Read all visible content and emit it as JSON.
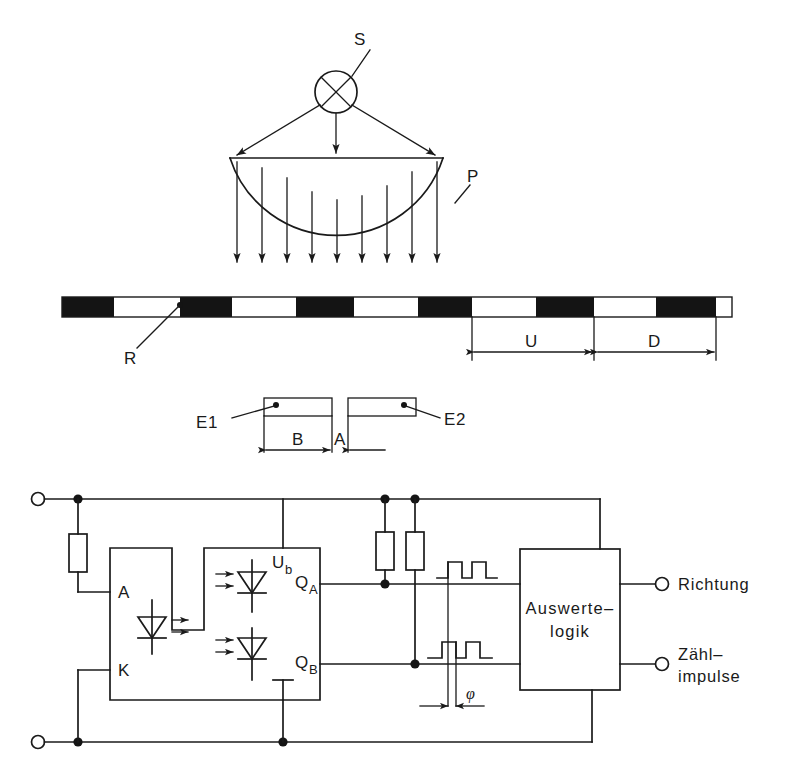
{
  "figure": {
    "kind": "technical-schematic",
    "ink_color": "#1a1a1a",
    "background_color": "#ffffff"
  },
  "optics": {
    "source_label": "S",
    "lens_label": "P",
    "light_ray_count": 3,
    "parallel_beam_arrow_count": 9
  },
  "scale": {
    "grating_label": "R",
    "pitch_label": "U",
    "dark_label": "D",
    "segments": [
      {
        "x": 62,
        "w": 52,
        "fill": "black"
      },
      {
        "x": 114,
        "w": 66,
        "fill": "white"
      },
      {
        "x": 180,
        "w": 52,
        "fill": "black"
      },
      {
        "x": 232,
        "w": 64,
        "fill": "white"
      },
      {
        "x": 296,
        "w": 58,
        "fill": "black"
      },
      {
        "x": 354,
        "w": 64,
        "fill": "white"
      },
      {
        "x": 418,
        "w": 54,
        "fill": "black"
      },
      {
        "x": 472,
        "w": 64,
        "fill": "white"
      },
      {
        "x": 536,
        "w": 58,
        "fill": "black"
      },
      {
        "x": 594,
        "w": 62,
        "fill": "white"
      },
      {
        "x": 656,
        "w": 60,
        "fill": "black"
      },
      {
        "x": 716,
        "w": 16,
        "fill": "white"
      }
    ]
  },
  "detectors": {
    "left_label": "E1",
    "right_label": "E2",
    "gap_label": "A",
    "width_label": "B"
  },
  "circuit": {
    "opto": {
      "anode_label": "A",
      "cathode_label": "K",
      "supply_label_main": "U",
      "supply_label_sub": "b",
      "ground_label": "⊥",
      "out_a_main": "Q",
      "out_a_sub": "A",
      "out_b_main": "Q",
      "out_b_sub": "B"
    },
    "logic_box": {
      "line1": "Auswerte–",
      "line2": "logik"
    },
    "phase_label": "φ",
    "outputs": [
      {
        "label": "Richtung"
      },
      {
        "label": "Zähl–"
      },
      {
        "label": "impulse"
      }
    ]
  }
}
